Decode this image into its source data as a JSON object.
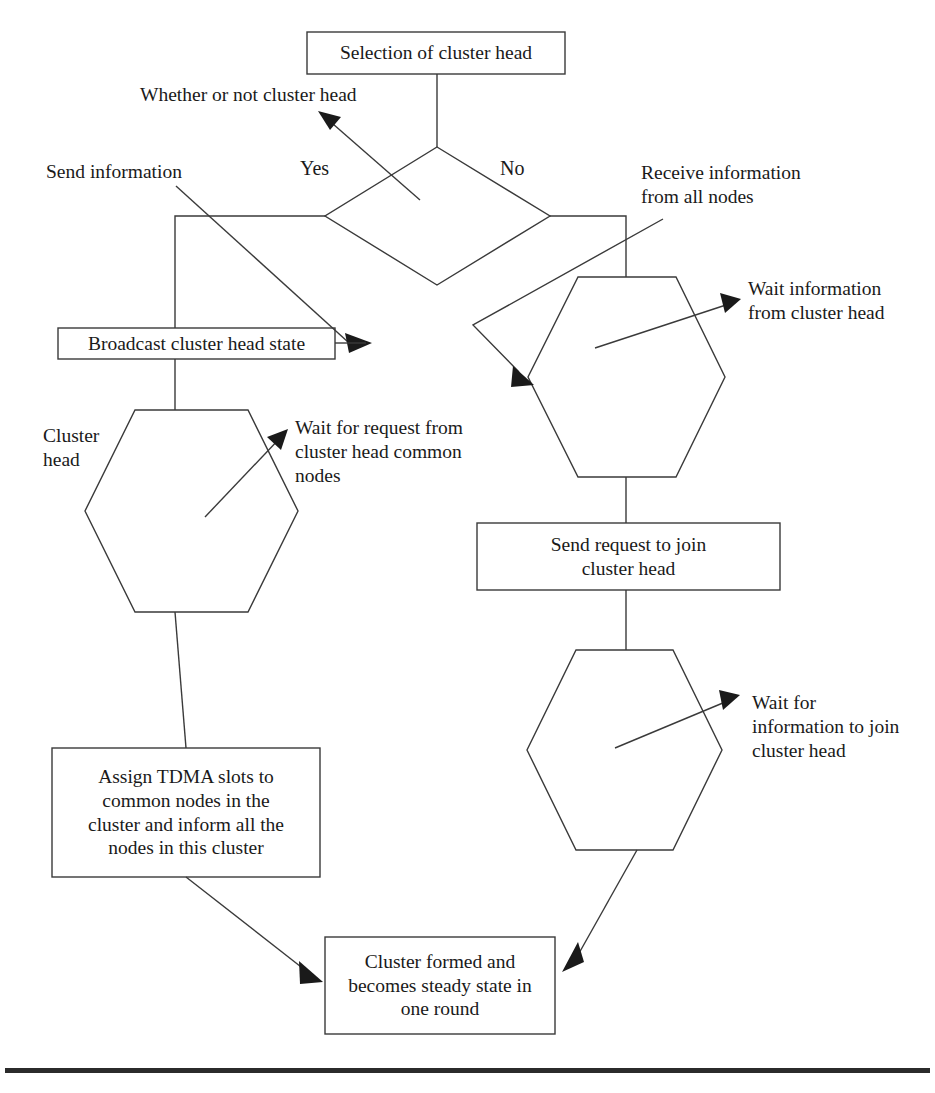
{
  "diagram": {
    "title_text": "Cluster head selection flowchart",
    "background_color": "#ffffff",
    "line_color": "#3a3a3a",
    "nodes": {
      "selection": {
        "label": "Selection of cluster head",
        "shape": "rectangle"
      },
      "decision": {
        "label": "",
        "shape": "diamond"
      },
      "broadcast": {
        "label": "Broadcast cluster head state",
        "shape": "rectangle"
      },
      "left_hexagon": {
        "label": "",
        "shape": "hexagon"
      },
      "tdma": {
        "label": "Assign TDMA slots to\ncommon nodes in the\ncluster and inform all the\nnodes in this cluster",
        "shape": "rectangle"
      },
      "right_hexagon_top": {
        "label": "",
        "shape": "hexagon"
      },
      "send_request": {
        "label": "Send request to join\ncluster head",
        "shape": "rectangle"
      },
      "right_hexagon_bottom": {
        "label": "",
        "shape": "hexagon"
      },
      "cluster_formed": {
        "label": "Cluster formed and\nbecomes steady state in\none round",
        "shape": "rectangle"
      }
    },
    "branch_labels": {
      "yes": "Yes",
      "no": "No"
    },
    "annotations": {
      "whether_or_not": "Whether or not cluster head",
      "send_information": "Send information",
      "receive_information": "Receive information\nfrom all nodes",
      "wait_info_from_ch": "Wait information\nfrom cluster head",
      "cluster_head": "Cluster\nhead",
      "wait_for_request": "Wait for request from\ncluster head common\nnodes",
      "wait_for_info_join": "Wait for\ninformation to join\ncluster head"
    }
  }
}
